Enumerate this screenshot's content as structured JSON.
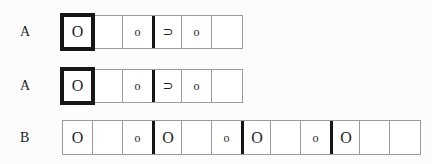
{
  "palette": {
    "background": "#fcfcfc",
    "thin_line": "#9b9b9b",
    "thick_line": "#161616",
    "text": "#1f1f1f"
  },
  "rows": [
    {
      "label": "A",
      "cells": [
        {
          "symbol": "O",
          "thick_box": true
        },
        {
          "symbol": ""
        },
        {
          "symbol": "o"
        },
        {
          "symbol": "⊃",
          "thick_left": true
        },
        {
          "symbol": "o"
        },
        {
          "symbol": ""
        }
      ]
    },
    {
      "label": "A",
      "cells": [
        {
          "symbol": "O",
          "thick_box": true
        },
        {
          "symbol": ""
        },
        {
          "symbol": "o"
        },
        {
          "symbol": "⊃",
          "thick_left": true
        },
        {
          "symbol": "o"
        },
        {
          "symbol": ""
        }
      ]
    },
    {
      "label": "B",
      "cells": [
        {
          "symbol": "O"
        },
        {
          "symbol": ""
        },
        {
          "symbol": "o"
        },
        {
          "symbol": "O",
          "thick_left": true
        },
        {
          "symbol": ""
        },
        {
          "symbol": "o"
        },
        {
          "symbol": "O",
          "thick_left": true
        },
        {
          "symbol": ""
        },
        {
          "symbol": "o"
        },
        {
          "symbol": "O",
          "thick_left": true
        },
        {
          "symbol": ""
        },
        {
          "symbol": ""
        }
      ]
    }
  ]
}
